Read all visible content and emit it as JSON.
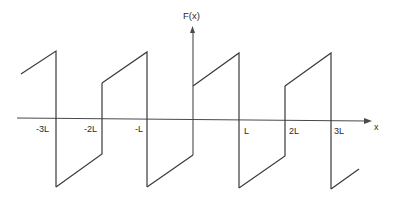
{
  "diagram": {
    "type": "periodic-function-graph",
    "y_axis_label": "F(x)",
    "x_axis_label": "x",
    "tick_labels": [
      "-3L",
      "-2L",
      "-L",
      "L",
      "2L",
      "3L"
    ],
    "colors": {
      "line": "#3a3a3a",
      "axis": "#4a4a4a",
      "text": "#2a2a2a",
      "background": "#ffffff"
    },
    "segments": [
      {
        "from_tick": "left-edge",
        "to_tick": "-3L",
        "position": "upper",
        "rising": true
      },
      {
        "from_tick": "-3L",
        "to_tick": "-2L",
        "position": "lower",
        "rising": true
      },
      {
        "from_tick": "-2L",
        "to_tick": "-L",
        "position": "upper",
        "rising": true
      },
      {
        "from_tick": "-L",
        "to_tick": "0",
        "position": "lower",
        "rising": true
      },
      {
        "from_tick": "0",
        "to_tick": "L",
        "position": "upper",
        "rising": true
      },
      {
        "from_tick": "L",
        "to_tick": "2L",
        "position": "lower",
        "rising": true
      },
      {
        "from_tick": "2L",
        "to_tick": "3L",
        "position": "upper",
        "rising": true
      },
      {
        "from_tick": "3L",
        "to_tick": "right-edge",
        "position": "lower",
        "rising": true
      }
    ]
  }
}
